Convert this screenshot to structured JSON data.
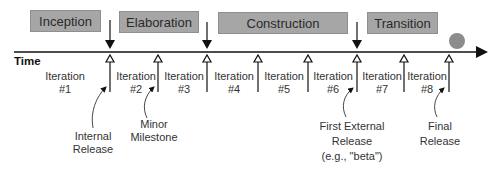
{
  "axis": {
    "label": "Time"
  },
  "phases": [
    {
      "name": "Inception"
    },
    {
      "name": "Elaboration"
    },
    {
      "name": "Construction"
    },
    {
      "name": "Transition"
    }
  ],
  "iterations": [
    {
      "label": "Iteration",
      "number": "#1"
    },
    {
      "label": "Iteration",
      "number": "#2"
    },
    {
      "label": "Iteration",
      "number": "#3"
    },
    {
      "label": "Iteration",
      "number": "#4"
    },
    {
      "label": "Iteration",
      "number": "#5"
    },
    {
      "label": "Iteration",
      "number": "#6"
    },
    {
      "label": "Iteration",
      "number": "#7"
    },
    {
      "label": "Iteration",
      "number": "#8"
    }
  ],
  "annotations": {
    "internal_release": {
      "line1": "Internal",
      "line2": "Release"
    },
    "minor_milestone": {
      "line1": "Minor",
      "line2": "Milestone"
    },
    "first_external_release": {
      "line1": "First External",
      "line2": "Release",
      "line3": "(e.g., \"beta\")"
    },
    "final_release": {
      "line1": "Final",
      "line2": "Release"
    }
  },
  "colors": {
    "phase_fill": "#a6a6a6",
    "circle_fill": "#8c8c8c",
    "line": "#111111"
  }
}
